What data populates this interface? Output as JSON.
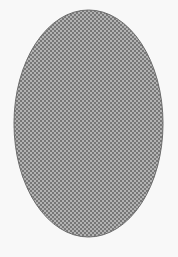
{
  "figure": {
    "shape": "ellipse",
    "fill_pattern": "checkerboard",
    "colors": {
      "background": "#f8f8f8",
      "pattern_dark": "#777777",
      "pattern_light": "#b3b3b3",
      "outline": "#6a6a6a"
    }
  }
}
